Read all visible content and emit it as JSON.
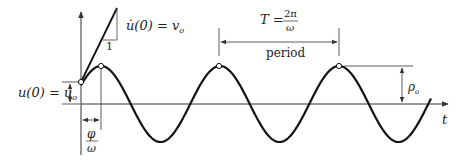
{
  "diagram": {
    "curve": {
      "type": "sinusoid",
      "cycles_shown": 3.1,
      "description": "u(t) = rho_o * sin(omega t + ...) starting at u_o with slope v_o"
    },
    "labels": {
      "velocity_lhs": "u̇(0) = v",
      "velocity_sub": "o",
      "slope_unit": "1",
      "displacement_lhs": "u(0) = u",
      "displacement_sub": "o",
      "period_T": "T =",
      "period_num": "2π",
      "period_den": "ω",
      "period_word": "period",
      "amplitude": "ρ",
      "amplitude_sub": "o",
      "phase_num": "φ",
      "phase_den": "ω",
      "time_axis": "t"
    },
    "colors": {
      "curve": "#111111",
      "axis": "#333333",
      "text": "#222222"
    }
  }
}
